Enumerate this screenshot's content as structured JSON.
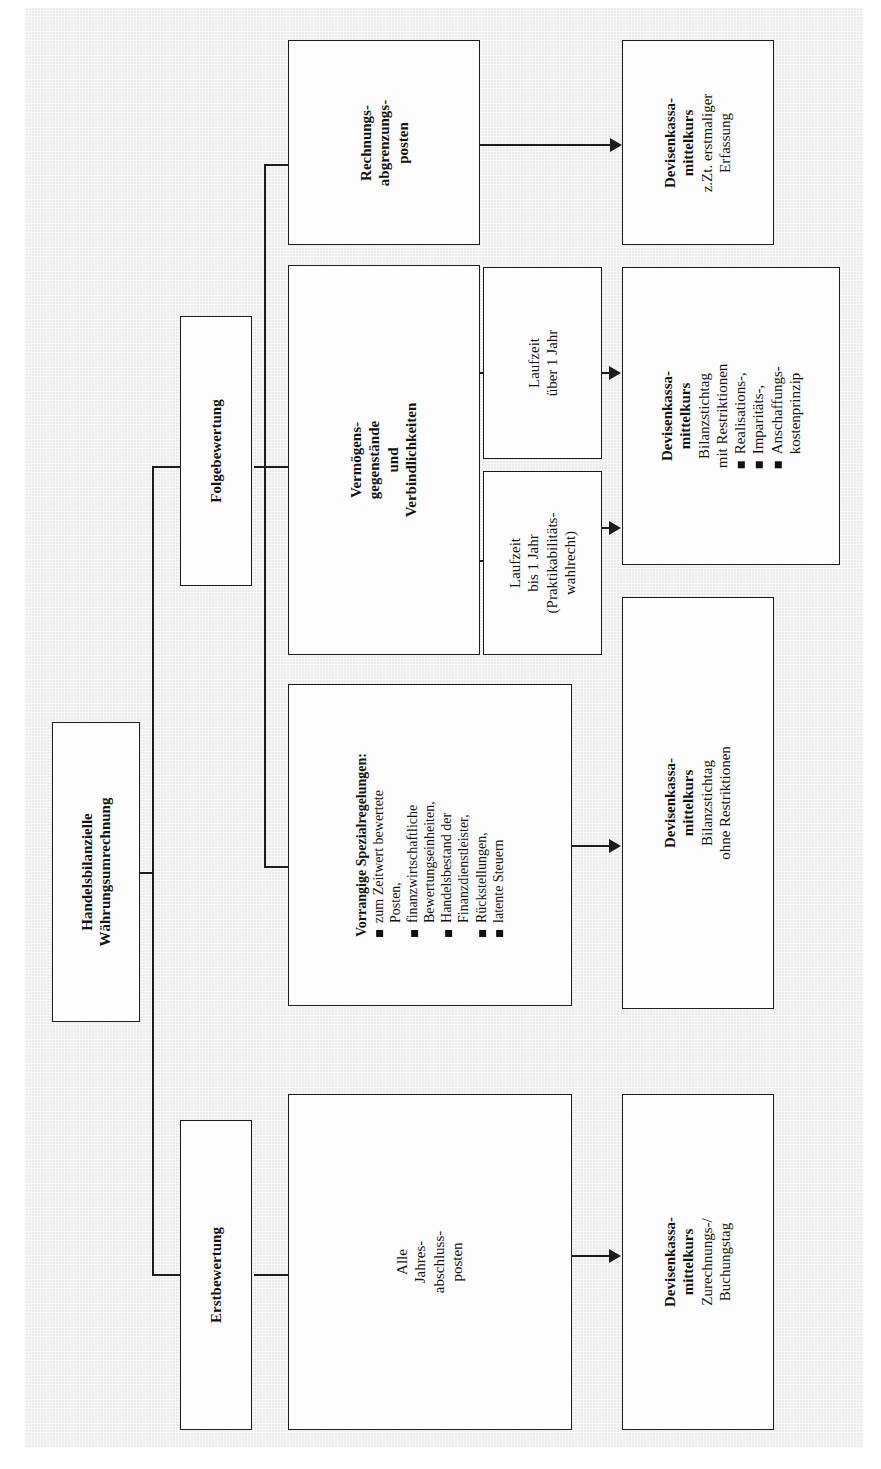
{
  "diagram": {
    "title": "Handelsbilanzielle Währungsumrechnung",
    "orientation": "rotated-90-ccw",
    "background_color": "#ececed",
    "box_fill": "#fdfdfd",
    "line_color": "#1d1d1d"
  },
  "root": {
    "line1": "Handelsbilanzielle",
    "line2": "Währungsumrechnung"
  },
  "branches": {
    "folgebewertung": {
      "label": "Folgebewertung"
    },
    "erstbewertung": {
      "label": "Erstbewertung"
    }
  },
  "nodes": {
    "rechnungsabgrenzungsposten": {
      "line1": "Rechnungs-",
      "line2": "abgrenzungs-",
      "line3": "posten"
    },
    "rap_result": {
      "title1": "Devisenkassa-",
      "title2": "mittelkurs",
      "sub1": "z.Zt. erstmaliger",
      "sub2": "Erfassung"
    },
    "vermoegensgegenstaende": {
      "line1": "Vermögens-",
      "line2": "gegenstände",
      "line3": "und",
      "line4": "Verbindlichkeiten"
    },
    "laufzeit_ueber": {
      "line1": "Laufzeit",
      "line2": "über 1 Jahr"
    },
    "laufzeit_bis": {
      "line1": "Laufzeit",
      "line2": "bis 1 Jahr",
      "line3": "(Praktikabilitäts-",
      "line4": "wahlrecht)"
    },
    "vg_result": {
      "title1": "Devisenkassa-",
      "title2": "mittelkurs",
      "sub1": "Bilanzstichtag",
      "sub2": "mit Restriktionen",
      "bullets": [
        "Realisations-,",
        "Imparitäts-,",
        "Anschaffungs-",
        "kostenprinzip"
      ]
    },
    "spezialregelungen": {
      "title": "Vorrangige Spezialregelungen:",
      "bullets": [
        "zum Zeitwert bewertete",
        "Posten,",
        "finanzwirtschaftliche",
        "Bewertungseinheiten,",
        "Handelsbestand der",
        "Finanzdienstleister,",
        "Rückstellungen,",
        "latente Steuern"
      ],
      "bullet_lines": [
        {
          "bullet": true,
          "text": "zum Zeitwert bewertete"
        },
        {
          "bullet": false,
          "text": "Posten,"
        },
        {
          "bullet": true,
          "text": "finanzwirtschaftliche"
        },
        {
          "bullet": false,
          "text": "Bewertungseinheiten,"
        },
        {
          "bullet": true,
          "text": "Handelsbestand der"
        },
        {
          "bullet": false,
          "text": "Finanzdienstleister,"
        },
        {
          "bullet": true,
          "text": "Rückstellungen,"
        },
        {
          "bullet": true,
          "text": "latente Steuern"
        }
      ]
    },
    "spezial_result": {
      "title1": "Devisenkassa-",
      "title2": "mittelkurs",
      "sub1": "Bilanzstichtag",
      "sub2": "ohne Restriktionen"
    },
    "alle_jap": {
      "line1": "Alle",
      "line2": "Jahres-",
      "line3": "abschluss-",
      "line4": "posten"
    },
    "erst_result": {
      "title1": "Devisenkassa-",
      "title2": "mittelkurs",
      "sub1": "Zurechnungs-/",
      "sub2": "Buchungstag"
    }
  }
}
